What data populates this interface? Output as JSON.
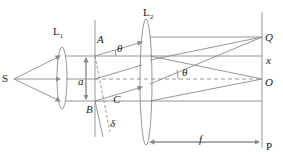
{
  "diagram": {
    "type": "optics-grating-fraunhofer",
    "labels": {
      "source": "S",
      "lens1": "L",
      "lens1_sub": "1",
      "lens2": "L",
      "lens2_sub": "2",
      "slit_top": "A",
      "slit_bottom": "B",
      "foot": "C",
      "slit_width": "a",
      "path_diff": "δ",
      "angle1": "θ",
      "angle2": "θ",
      "point_q": "Q",
      "point_o": "O",
      "distance_x": "x",
      "focal": "f",
      "screen": "P"
    },
    "colors": {
      "line": "#8a8a8a",
      "text": "#222222",
      "background": "#ffffff"
    }
  }
}
